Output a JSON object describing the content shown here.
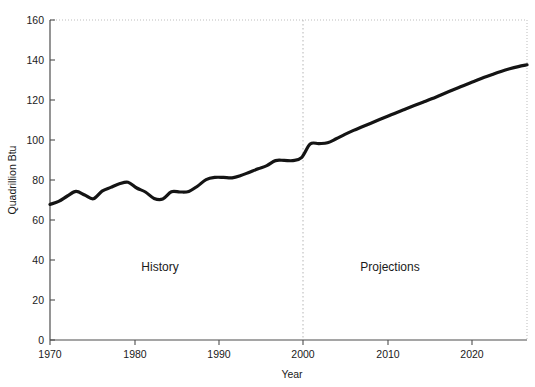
{
  "chart_data": {
    "type": "line",
    "title": "",
    "xlabel": "Year",
    "ylabel": "Quadrillion Btu",
    "xlim": [
      1970,
      2025
    ],
    "ylim": [
      0,
      160
    ],
    "xticks": [
      1970,
      1980,
      1990,
      2000,
      2010,
      2020
    ],
    "xtick_labels": [
      "1970",
      "1980",
      "1990",
      "2000",
      "2010",
      "2020"
    ],
    "yticks": [
      0,
      20,
      40,
      60,
      80,
      100,
      120,
      140,
      160
    ],
    "ytick_labels": [
      "0",
      "20",
      "40",
      "60",
      "80",
      "100",
      "120",
      "140",
      "160"
    ],
    "grid": false,
    "legend": "none",
    "annotations": [
      {
        "text": "History",
        "x": 1984,
        "y": 32
      },
      {
        "text": "Projections",
        "x": 2010,
        "y": 32
      }
    ],
    "divider": {
      "x": 2000,
      "style": "dotted",
      "label": "history-projection split"
    },
    "series": [
      {
        "name": "Total energy consumption",
        "color": "#141414",
        "x": [
          1970,
          1971,
          1972,
          1973,
          1974,
          1975,
          1976,
          1977,
          1978,
          1979,
          1980,
          1981,
          1982,
          1983,
          1984,
          1985,
          1986,
          1987,
          1988,
          1989,
          1990,
          1991,
          1992,
          1993,
          1994,
          1995,
          1996,
          1997,
          1998,
          1999,
          2000,
          2001,
          2002,
          2003,
          2004,
          2005,
          2006,
          2007,
          2008,
          2009,
          2010,
          2011,
          2012,
          2013,
          2014,
          2015,
          2016,
          2017,
          2018,
          2019,
          2020,
          2021,
          2022,
          2023,
          2024,
          2025
        ],
        "values": [
          67.8,
          69.3,
          72.0,
          74.3,
          72.5,
          70.6,
          74.4,
          76.3,
          78.1,
          78.9,
          76.0,
          74.0,
          70.8,
          70.5,
          74.1,
          74.0,
          74.3,
          76.9,
          80.2,
          81.3,
          81.3,
          81.1,
          82.2,
          83.9,
          85.6,
          87.2,
          89.7,
          89.8,
          89.7,
          91.2,
          98.0,
          98.2,
          98.6,
          100.6,
          102.8,
          104.8,
          106.6,
          108.4,
          110.2,
          112.0,
          113.8,
          115.5,
          117.2,
          118.9,
          120.6,
          122.4,
          124.2,
          126.0,
          127.8,
          129.5,
          131.2,
          132.8,
          134.3,
          135.6,
          136.7,
          137.6
        ]
      }
    ]
  }
}
